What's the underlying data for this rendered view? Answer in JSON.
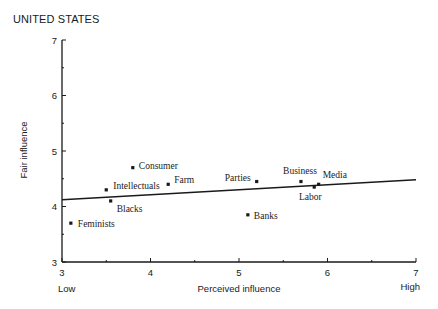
{
  "chart_data": {
    "type": "scatter",
    "title": "UNITED STATES",
    "xlabel": "Perceived influence",
    "ylabel": "Fair influence",
    "x_low_label": "Low",
    "x_high_label": "High",
    "xlim": [
      3,
      7
    ],
    "ylim": [
      3,
      7
    ],
    "xticks": [
      "3",
      "4",
      "5",
      "6",
      "7"
    ],
    "yticks": [
      "3",
      "4",
      "5",
      "6",
      "7"
    ],
    "grid": false,
    "legend": "none",
    "points": [
      {
        "label": "Feminists",
        "x": 3.1,
        "y": 3.7
      },
      {
        "label": "Intellectuals",
        "x": 3.5,
        "y": 4.3
      },
      {
        "label": "Blacks",
        "x": 3.55,
        "y": 4.1
      },
      {
        "label": "Consumer",
        "x": 3.8,
        "y": 4.7
      },
      {
        "label": "Farm",
        "x": 4.2,
        "y": 4.4
      },
      {
        "label": "Banks",
        "x": 5.1,
        "y": 3.85
      },
      {
        "label": "Parties",
        "x": 5.2,
        "y": 4.45
      },
      {
        "label": "Business",
        "x": 5.7,
        "y": 4.45
      },
      {
        "label": "Labor",
        "x": 5.85,
        "y": 4.35
      },
      {
        "label": "Media",
        "x": 5.9,
        "y": 4.4
      }
    ],
    "trend_line": {
      "x": [
        3,
        7
      ],
      "y": [
        4.12,
        4.48
      ]
    }
  }
}
